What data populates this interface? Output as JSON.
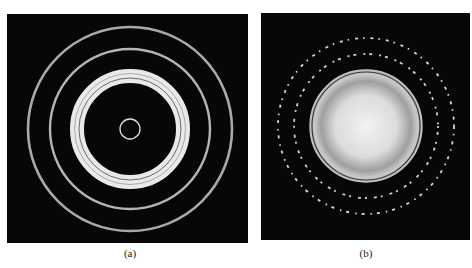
{
  "figure": {
    "panels": [
      {
        "id": "a",
        "caption": "(a)",
        "description": "Electron diffraction pattern with continuous concentric rings (polycrystalline)",
        "colors": {
          "background": "#070707",
          "ring": "#bdbdbd",
          "band": "#e8e8e8"
        }
      },
      {
        "id": "b",
        "caption": "(b)",
        "description": "Diffraction pattern with bright central diffuse disk and spotty/dashed outer rings",
        "colors": {
          "background": "#070707",
          "disk": "#d9d9d9",
          "dashes": "#dddddd"
        }
      }
    ]
  }
}
